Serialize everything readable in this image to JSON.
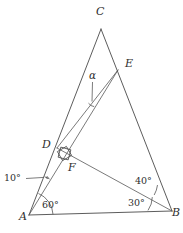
{
  "figure": {
    "kind": "geometry-diagram",
    "background_color": "#ffffff",
    "line_color": "#4a4a4a",
    "label_color": "#2e2e2e"
  },
  "vertices": [
    {
      "name": "C",
      "label": "C",
      "label_x": 96,
      "label_y": 6,
      "px": 101,
      "py": 29
    },
    {
      "name": "E",
      "label": "E",
      "label_x": 125,
      "label_y": 58,
      "px": 118,
      "py": 70
    },
    {
      "name": "D",
      "label": "D",
      "label_x": 42,
      "label_y": 139,
      "px": 57,
      "py": 148
    },
    {
      "name": "F",
      "label": "F",
      "label_x": 68,
      "label_y": 162,
      "px": 70,
      "py": 158
    },
    {
      "name": "A",
      "label": "A",
      "label_x": 19,
      "label_y": 211,
      "px": 29,
      "py": 215
    },
    {
      "name": "B",
      "label": "B",
      "label_x": 172,
      "label_y": 207,
      "px": 172,
      "py": 211
    }
  ],
  "angles": [
    {
      "name": "angle-at-A-base",
      "label": "60°",
      "x": 42,
      "y": 200
    },
    {
      "name": "angle-at-B-base",
      "label": "30°",
      "x": 128,
      "y": 198
    },
    {
      "name": "angle-at-B-upper",
      "label": "40°",
      "x": 135,
      "y": 176
    },
    {
      "name": "angle-at-A-small",
      "label": "10°",
      "x": 4,
      "y": 173
    },
    {
      "name": "angle-alpha",
      "label": "α",
      "x": 89,
      "y": 70
    }
  ],
  "markers": {
    "right_angle_at_F": "right-angle-square",
    "alpha_leader": "leader-line-from-alpha-to-angle",
    "ten_degree_leader": "leader-line-from-10-degrees-to-angle"
  }
}
